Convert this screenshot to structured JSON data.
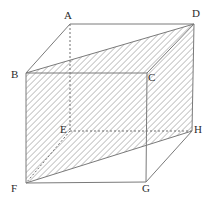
{
  "figure": {
    "type": "geometry-diagram",
    "canvas": {
      "width": 211,
      "height": 202,
      "background": "#ffffff"
    },
    "style": {
      "edge_color": "#7a7a7a",
      "hidden_edge_color": "#6e6e6e",
      "hatch_color": "#9a9a9a",
      "label_color": "#2b2b2b",
      "edge_width": 1,
      "hidden_dash": "2,2",
      "hatch_spacing": 3,
      "hatch_angle_deg": 45
    },
    "vertices": [
      {
        "name": "A",
        "label": "A",
        "x": 70,
        "y": 24,
        "label_x": 64,
        "label_y": 10,
        "hidden": true
      },
      {
        "name": "B",
        "label": "B",
        "x": 26,
        "y": 73,
        "label_x": 11,
        "label_y": 69,
        "hidden": false
      },
      {
        "name": "C",
        "label": "C",
        "x": 147,
        "y": 73,
        "label_x": 148,
        "label_y": 72,
        "hidden": false
      },
      {
        "name": "D",
        "label": "D",
        "x": 194,
        "y": 24,
        "label_x": 192,
        "label_y": 8,
        "hidden": false
      },
      {
        "name": "E",
        "label": "E",
        "x": 70,
        "y": 131,
        "label_x": 60,
        "label_y": 124,
        "hidden": true
      },
      {
        "name": "F",
        "label": "F",
        "x": 26,
        "y": 183,
        "label_x": 11,
        "label_y": 183,
        "hidden": false
      },
      {
        "name": "G",
        "label": "G",
        "x": 146,
        "y": 182,
        "label_x": 142,
        "label_y": 183,
        "hidden": false
      },
      {
        "name": "H",
        "label": "H",
        "x": 192,
        "y": 131,
        "label_x": 194,
        "label_y": 124,
        "hidden": false
      }
    ],
    "solid_edges": [
      {
        "name": "edge-A-D",
        "from": "A",
        "to": "D"
      },
      {
        "name": "edge-A-B",
        "from": "A",
        "to": "B"
      },
      {
        "name": "edge-B-C",
        "from": "B",
        "to": "C"
      },
      {
        "name": "edge-C-D",
        "from": "C",
        "to": "D"
      },
      {
        "name": "edge-B-F",
        "from": "B",
        "to": "F"
      },
      {
        "name": "edge-C-G",
        "from": "C",
        "to": "G"
      },
      {
        "name": "edge-D-H",
        "from": "D",
        "to": "H"
      },
      {
        "name": "edge-F-G",
        "from": "F",
        "to": "G"
      },
      {
        "name": "edge-G-H",
        "from": "G",
        "to": "H"
      },
      {
        "name": "edge-F-H",
        "from": "F",
        "to": "H"
      },
      {
        "name": "edge-B-D",
        "from": "B",
        "to": "D"
      }
    ],
    "hidden_edges": [
      {
        "name": "edge-A-E",
        "from": "A",
        "to": "E"
      },
      {
        "name": "edge-E-F",
        "from": "E",
        "to": "F"
      },
      {
        "name": "edge-E-H",
        "from": "E",
        "to": "H"
      }
    ],
    "shaded_regions": [
      {
        "name": "region-B-D-C",
        "vertices": [
          "B",
          "D",
          "C"
        ]
      },
      {
        "name": "region-B-C-H-F",
        "vertices": [
          "B",
          "C",
          "H",
          "F"
        ]
      },
      {
        "name": "region-C-D-H",
        "vertices": [
          "C",
          "D",
          "H"
        ]
      }
    ]
  }
}
